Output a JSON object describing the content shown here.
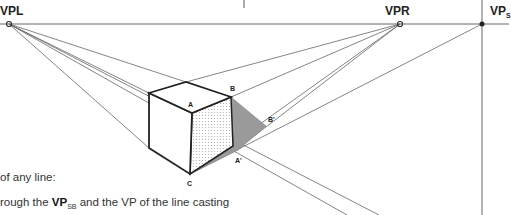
{
  "diagram": {
    "vanishing_points": {
      "left": {
        "label": "VPL",
        "x": 9,
        "y": 24
      },
      "right": {
        "label": "VPR",
        "x": 400,
        "y": 24
      },
      "shadow": {
        "label": "VP",
        "subscript": "S",
        "x": 482,
        "y": 24
      }
    },
    "points": {
      "A": {
        "label": "A",
        "x": 192,
        "y": 113
      },
      "B": {
        "label": "B",
        "x": 231,
        "y": 97
      },
      "C": {
        "label": "C",
        "x": 190,
        "y": 174
      },
      "A_prime": {
        "label": "A'",
        "x": 238,
        "y": 150
      },
      "B_prime": {
        "label": "B'",
        "x": 266,
        "y": 126
      }
    },
    "colors": {
      "line": "#555555",
      "edge": "#222222",
      "shadow": "#9a9a9a",
      "face_dots": "#bbbbbb"
    }
  },
  "text": {
    "line1": "of any line:",
    "line2_prefix": "rough the ",
    "line2_bold": "VP",
    "line2_sub": "SB",
    "line2_suffix": " and the VP of the line casting"
  }
}
